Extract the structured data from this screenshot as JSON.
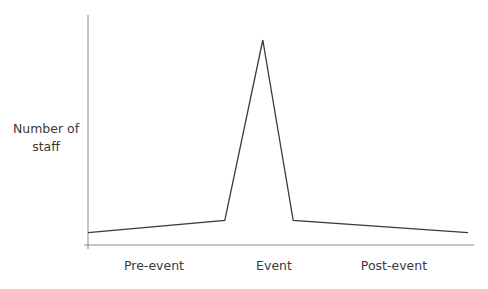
{
  "chart_data": {
    "type": "line",
    "title": "",
    "xlabel": "",
    "ylabel": "Number of staff",
    "categories": [
      "Pre-event",
      "Event",
      "Post-event"
    ],
    "x_tick_labels": [
      "Pre-event",
      "Event",
      "Post-event"
    ],
    "series": [
      {
        "name": "Number of staff",
        "x": [
          0,
          0.36,
          0.46,
          0.54,
          1.0
        ],
        "values": [
          6,
          12,
          100,
          12,
          6
        ]
      }
    ],
    "ylim": [
      0,
      110
    ],
    "grid": false,
    "legend": null
  },
  "axes": {
    "ylabel_line1": "Number of",
    "ylabel_line2": "staff"
  },
  "colors": {
    "line": "#3a3a3a",
    "axis": "#8a8a8a",
    "text": "#3a3a3a"
  }
}
